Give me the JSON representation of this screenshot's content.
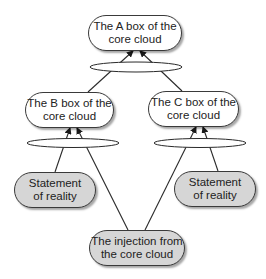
{
  "diagram": {
    "nodes": {
      "a_box": {
        "label": "The A box of the core cloud",
        "fill": "#ffffff"
      },
      "b_box": {
        "label": "The B box of the core cloud",
        "fill": "#ffffff"
      },
      "c_box": {
        "label": "The C box of the core cloud",
        "fill": "#ffffff"
      },
      "reality_left": {
        "label": "Statement of reality",
        "fill": "#d6d6d6"
      },
      "reality_right": {
        "label": "Statement of reality",
        "fill": "#d6d6d6"
      },
      "injection": {
        "label": "The injection from the core cloud",
        "fill": "#d6d6d6"
      }
    },
    "edges": [
      {
        "from": "b_box",
        "to": "a_box",
        "via": "and-ellipse-top"
      },
      {
        "from": "c_box",
        "to": "a_box",
        "via": "and-ellipse-top"
      },
      {
        "from": "reality_left",
        "to": "b_box",
        "via": "and-ellipse-left"
      },
      {
        "from": "injection",
        "to": "b_box",
        "via": "and-ellipse-left"
      },
      {
        "from": "injection",
        "to": "c_box",
        "via": "and-ellipse-right"
      },
      {
        "from": "reality_right",
        "to": "c_box",
        "via": "and-ellipse-right"
      }
    ],
    "line_color": "#2a2a2a"
  }
}
